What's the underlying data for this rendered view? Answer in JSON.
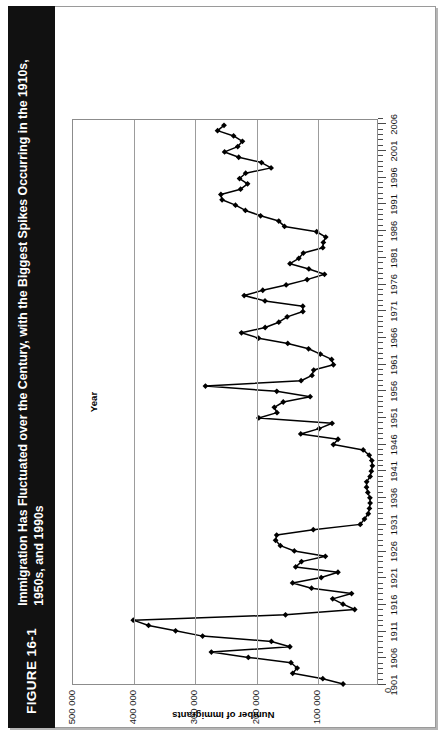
{
  "figure": {
    "label": "FIGURE 16-1",
    "title": "Immigration Has Fluctuated over the Century, with the Biggest Spikes Occurring in the 1910s, 1950s, and 1990s"
  },
  "axes": {
    "y_title": "Number of Immigrants",
    "x_title": "Year",
    "y_ticks": [
      "0",
      "100 000",
      "200 000",
      "300 000",
      "400 000",
      "500 000"
    ],
    "y_min": 0,
    "y_max": 500000,
    "origin_label": "0",
    "x_ticks": [
      "1901",
      "1906",
      "1911",
      "1916",
      "1921",
      "1926",
      "1931",
      "1936",
      "1941",
      "1946",
      "1951",
      "1956",
      "1961",
      "1966",
      "1971",
      "1976",
      "1981",
      "1986",
      "1991",
      "1996",
      "2001",
      "2006"
    ],
    "x_min": 1901,
    "x_max": 2007
  },
  "chart_data": {
    "type": "line",
    "title": "Immigration Has Fluctuated over the Century, with the Biggest Spikes Occurring in the 1910s, 1950s, and 1990s",
    "xlabel": "Year",
    "ylabel": "Number of Immigrants",
    "xlim": [
      1901,
      2007
    ],
    "ylim": [
      0,
      500000
    ],
    "grid": true,
    "legend": "none",
    "marker": "diamond",
    "x": [
      1901,
      1902,
      1903,
      1904,
      1905,
      1906,
      1907,
      1908,
      1909,
      1910,
      1911,
      1912,
      1913,
      1914,
      1915,
      1916,
      1917,
      1918,
      1919,
      1920,
      1921,
      1922,
      1923,
      1924,
      1925,
      1926,
      1927,
      1928,
      1929,
      1930,
      1931,
      1932,
      1933,
      1934,
      1935,
      1936,
      1937,
      1938,
      1939,
      1940,
      1941,
      1942,
      1943,
      1944,
      1945,
      1946,
      1947,
      1948,
      1949,
      1950,
      1951,
      1952,
      1953,
      1954,
      1955,
      1956,
      1957,
      1958,
      1959,
      1960,
      1961,
      1962,
      1963,
      1964,
      1965,
      1966,
      1967,
      1968,
      1969,
      1970,
      1971,
      1972,
      1973,
      1974,
      1975,
      1976,
      1977,
      1978,
      1979,
      1980,
      1981,
      1982,
      1983,
      1984,
      1985,
      1986,
      1987,
      1988,
      1989,
      1990,
      1991,
      1992,
      1993,
      1994,
      1995,
      1996,
      1997,
      1998,
      1999,
      2000,
      2001,
      2002,
      2003,
      2004,
      2005,
      2006
    ],
    "y": [
      55747,
      89102,
      138660,
      131252,
      141465,
      211653,
      272409,
      143326,
      173694,
      286839,
      331288,
      375756,
      400870,
      150484,
      36665,
      55914,
      72910,
      41845,
      107698,
      138824,
      91728,
      64224,
      133729,
      124164,
      84907,
      135982,
      158886,
      166783,
      164993,
      104806,
      27530,
      20591,
      14382,
      12476,
      11277,
      11643,
      15101,
      17244,
      16994,
      11324,
      9329,
      7576,
      8504,
      12801,
      22722,
      71719,
      64127,
      125414,
      95217,
      73912,
      194391,
      164498,
      168868,
      154227,
      109946,
      164857,
      282164,
      124851,
      106928,
      104111,
      71689,
      74586,
      93151,
      112606,
      146758,
      194743,
      222876,
      183974,
      161531,
      147713,
      121900,
      122006,
      184200,
      218465,
      187881,
      149429,
      114914,
      86313,
      112096,
      143117,
      128618,
      121147,
      89157,
      88239,
      84302,
      99219,
      152098,
      161584,
      191493,
      216452,
      232744,
      254817,
      256741,
      224364,
      212865,
      226071,
      216038,
      174195,
      189951,
      227455,
      250638,
      229048,
      221352,
      235823,
      262236,
      251642
    ],
    "series": [
      {
        "name": "Number of Immigrants",
        "peak_year": 1913,
        "peak_value": 400870,
        "min_year": 1942,
        "min_value": 7576
      }
    ]
  }
}
